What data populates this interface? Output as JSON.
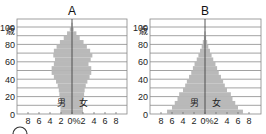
{
  "chart_data": [
    {
      "type": "bar",
      "subtype": "population-pyramid",
      "title": "A",
      "ylabel": "歳",
      "xlabel": "%",
      "male_label": "男",
      "female_label": "女",
      "y_ticks": [
        "0",
        "20",
        "40",
        "60",
        "80",
        "100"
      ],
      "y_tick_values": [
        0,
        20,
        40,
        60,
        80,
        100
      ],
      "x_tick_labels": [
        "8",
        "6",
        "4",
        "2",
        "0%",
        "2",
        "4",
        "6",
        "8"
      ],
      "x_tick_values": [
        -8,
        -6,
        -4,
        -2,
        0,
        2,
        4,
        6,
        8
      ],
      "xlim": [
        -10,
        10
      ],
      "ylim": [
        0,
        110
      ],
      "grid": true,
      "age_groups": [
        0,
        5,
        10,
        15,
        20,
        25,
        30,
        35,
        40,
        45,
        50,
        55,
        60,
        65,
        70,
        75,
        80,
        85,
        90,
        95,
        100
      ],
      "series": [
        {
          "name": "男",
          "values": [
            2.1,
            2.1,
            2.1,
            2.2,
            2.3,
            2.4,
            2.6,
            2.9,
            3.3,
            3.7,
            3.7,
            3.3,
            3.1,
            3.4,
            3.3,
            2.8,
            2.2,
            1.5,
            0.9,
            0.4,
            0.1
          ]
        },
        {
          "name": "女",
          "values": [
            2.0,
            2.0,
            2.0,
            2.1,
            2.2,
            2.3,
            2.5,
            2.8,
            3.2,
            3.5,
            3.5,
            3.0,
            3.4,
            3.7,
            3.3,
            2.7,
            2.1,
            1.4,
            0.8,
            0.3,
            0.1
          ]
        }
      ]
    },
    {
      "type": "bar",
      "subtype": "population-pyramid",
      "title": "B",
      "ylabel": "歳",
      "xlabel": "%",
      "male_label": "男",
      "female_label": "女",
      "y_ticks": [
        "0",
        "20",
        "40",
        "60",
        "80",
        "100"
      ],
      "y_tick_values": [
        0,
        20,
        40,
        60,
        80,
        100
      ],
      "x_tick_labels": [
        "8",
        "6",
        "4",
        "2",
        "0%",
        "2",
        "4",
        "6",
        "8"
      ],
      "x_tick_values": [
        -8,
        -6,
        -4,
        -2,
        0,
        2,
        4,
        6,
        8
      ],
      "xlim": [
        -10,
        10
      ],
      "ylim": [
        0,
        110
      ],
      "grid": true,
      "age_groups": [
        0,
        5,
        10,
        15,
        20,
        25,
        30,
        35,
        40,
        45,
        50,
        55,
        60,
        65,
        70,
        75,
        80,
        85,
        90
      ],
      "series": [
        {
          "name": "男",
          "values": [
            6.9,
            6.0,
            5.5,
            5.0,
            4.7,
            4.0,
            3.6,
            3.3,
            2.9,
            2.5,
            2.2,
            1.9,
            1.5,
            1.2,
            0.9,
            0.6,
            0.4,
            0.2,
            0.1
          ]
        },
        {
          "name": "女",
          "values": [
            6.9,
            6.0,
            5.5,
            5.0,
            4.7,
            4.0,
            3.6,
            3.3,
            2.9,
            2.5,
            2.2,
            1.9,
            1.5,
            1.2,
            0.9,
            0.6,
            0.4,
            0.2,
            0.1
          ]
        }
      ]
    }
  ],
  "decor": {
    "question_marker": "circle"
  }
}
